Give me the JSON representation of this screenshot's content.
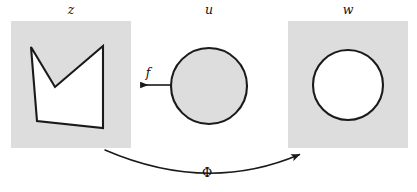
{
  "figure": {
    "type": "math-diagram",
    "background_color": "#ffffff",
    "panel_fill": "#dddddd",
    "stroke_color": "#1a1a1a",
    "white_fill": "#ffffff"
  },
  "panels": [
    {
      "key": "z",
      "label": "z",
      "label_x": 71,
      "label_y": 14,
      "frame": {
        "x": 11,
        "y": 21,
        "width": 120,
        "height": 127
      },
      "fill": "#dddddd",
      "shape": {
        "kind": "polygon",
        "fill": "#ffffff",
        "stroke": "#1a1a1a",
        "stroke_width": 2.1,
        "points": "31,47 55,87 103,46 103,128 37,121"
      }
    },
    {
      "key": "u",
      "label": "u",
      "label_x": 209,
      "label_y": 14,
      "frame": null,
      "fill": "#ffffff",
      "shape": {
        "kind": "circle",
        "fill": "#dddddd",
        "stroke": "#1a1a1a",
        "stroke_width": 2.1,
        "cx": 209,
        "cy": 86,
        "r": 38
      }
    },
    {
      "key": "w",
      "label": "w",
      "label_x": 348,
      "label_y": 14,
      "frame": {
        "x": 288,
        "y": 21,
        "width": 120,
        "height": 127
      },
      "fill": "#dddddd",
      "shape": {
        "kind": "circle",
        "fill": "#ffffff",
        "stroke": "#1a1a1a",
        "stroke_width": 2.1,
        "cx": 348,
        "cy": 85,
        "r": 35
      }
    }
  ],
  "arrows": [
    {
      "key": "f",
      "label": "f",
      "label_x": 148,
      "label_y": 77,
      "kind": "straight",
      "direction": "left",
      "from_x": 171,
      "from_y": 85,
      "to_x": 137,
      "to_y": 85,
      "stroke": "#1a1a1a",
      "stroke_width": 1.6
    },
    {
      "key": "Phi",
      "label": "Φ",
      "label_x": 207,
      "label_y": 177,
      "kind": "curved",
      "direction": "right",
      "path": "M 105,150 Q 207,194 303,153",
      "from_x": 105,
      "from_y": 150,
      "to_x": 305,
      "to_y": 152,
      "stroke": "#1a1a1a",
      "stroke_width": 1.5
    }
  ]
}
